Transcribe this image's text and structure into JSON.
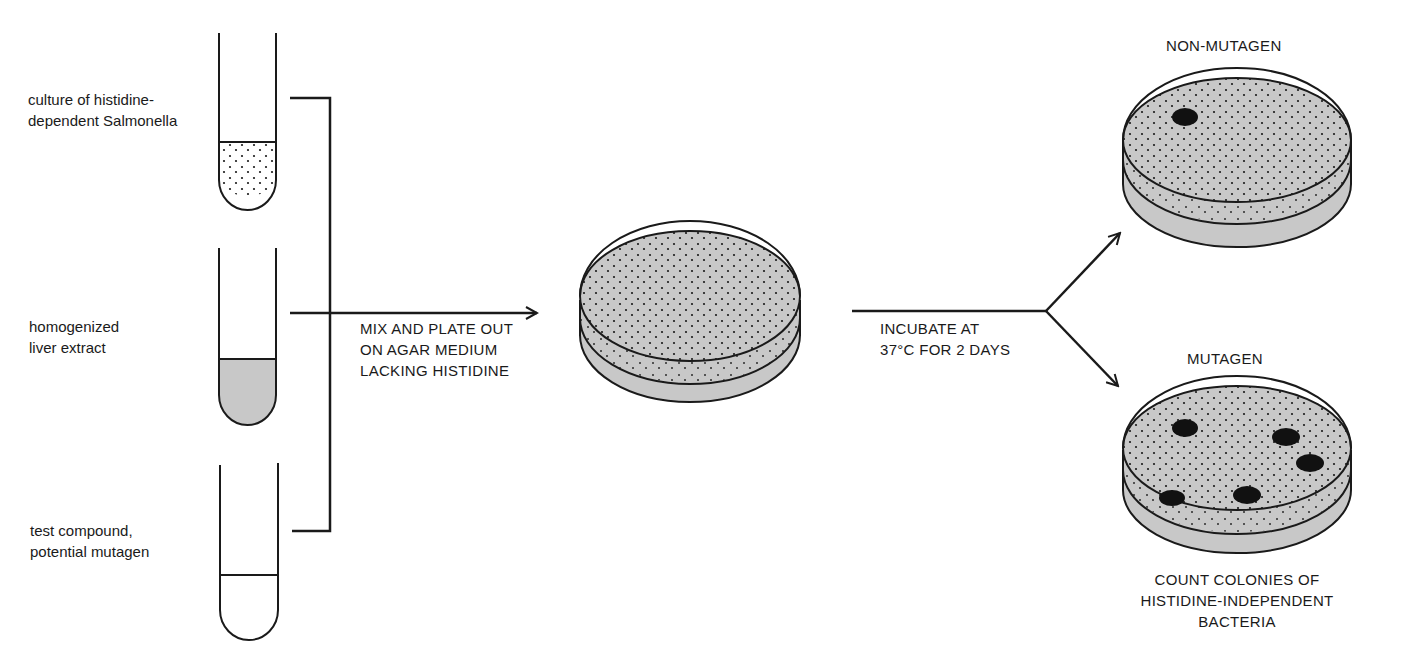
{
  "colors": {
    "ink": "#1a1a1a",
    "agar_fill": "#c8c8c8",
    "background": "#ffffff"
  },
  "tubes": [
    {
      "id": "tube-salmonella",
      "label_line1": "culture of histidine-",
      "label_line2": "dependent Salmonella",
      "fill": "dotted"
    },
    {
      "id": "tube-liver",
      "label_line1": "homogenized",
      "label_line2": "liver extract",
      "fill": "gray"
    },
    {
      "id": "tube-compound",
      "label_line1": "test compound,",
      "label_line2": "potential mutagen",
      "fill": "clear"
    }
  ],
  "steps": {
    "mix": {
      "line1": "MIX AND PLATE OUT",
      "line2": "ON AGAR MEDIUM",
      "line3": "LACKING HISTIDINE"
    },
    "incubate": {
      "line1": "INCUBATE AT",
      "line2": "37°C FOR 2 DAYS"
    }
  },
  "outcomes": {
    "non_mutagen": {
      "label": "NON-MUTAGEN",
      "colonies": 1
    },
    "mutagen": {
      "label": "MUTAGEN",
      "colonies": 5
    }
  },
  "conclusion": {
    "line1": "COUNT COLONIES OF",
    "line2": "HISTIDINE-INDEPENDENT",
    "line3": "BACTERIA"
  }
}
